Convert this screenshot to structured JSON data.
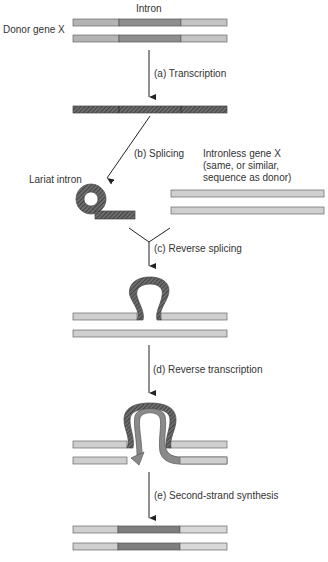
{
  "labels": {
    "intron": "Intron",
    "donor_gene": "Donor gene X",
    "lariat_intron": "Lariat intron",
    "intronless_line1": "Intronless gene X",
    "intronless_line2": "(same, or similar,",
    "intronless_line3": "sequence as donor)"
  },
  "steps": [
    {
      "id": "a",
      "label": "(a) Transcription"
    },
    {
      "id": "b",
      "label": "(b) Splicing"
    },
    {
      "id": "c",
      "label": "(c) Reverse splicing"
    },
    {
      "id": "d",
      "label": "(d) Reverse transcription"
    },
    {
      "id": "e",
      "label": "(e) Second-strand synthesis"
    }
  ],
  "colors": {
    "exon": "#c8c8c8",
    "intron": "#8a8a8a",
    "rna": "#5a5a5a",
    "cdna": "#7a7a7a",
    "outline": "#555555",
    "arrow": "#222222"
  }
}
